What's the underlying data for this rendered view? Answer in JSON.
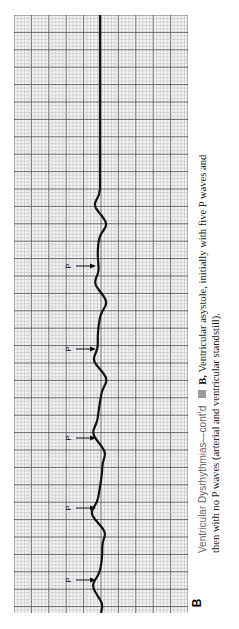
{
  "figure": {
    "panel_label": "B",
    "caption_lead": "Ventricular Dysrhythmias—cont’d",
    "caption_marker_icon": "square-bullet-icon",
    "caption_panel_ref": "B,",
    "caption_line1_rest": " Ventricular asystole, initially with five P waves and",
    "caption_line2": "then with no P waves (arterial and ventricular standstill)."
  },
  "ecg_strip": {
    "orientation": "rotated-90-ccw",
    "grid": "ECG paper, small and large squares",
    "p_wave_label": "P",
    "p_wave_count": 5,
    "rhythm_phases": [
      "P waves without QRS",
      "flat line (standstill)"
    ]
  },
  "colors": {
    "grid_minor": "#b8b8b8",
    "grid_major": "#5a5a5a",
    "trace": "#111111",
    "caption_lead": "#666666",
    "marker": "#999999"
  }
}
